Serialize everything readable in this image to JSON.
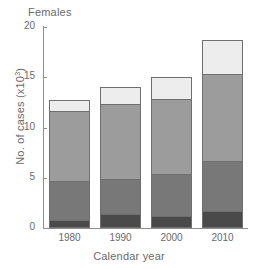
{
  "chart_data": {
    "type": "bar",
    "title": "Females",
    "subtitle": "",
    "xlabel": "Calendar year",
    "ylabel_prefix": "No. of cases (x10",
    "ylabel_sup": "3",
    "ylabel_suffix": ")",
    "ylabel_full": "No. of cases (x10³)",
    "categories": [
      "1980",
      "1990",
      "2000",
      "2010"
    ],
    "ylim": [
      0,
      20
    ],
    "yticks": [
      0,
      5,
      10,
      15,
      20
    ],
    "ytick_labels": [
      "0",
      "5",
      "10",
      "15",
      "20"
    ],
    "grid": false,
    "legend": "none",
    "stacked": true,
    "series": [
      {
        "name": "segment-1-bottom",
        "color": "#4a4a4a",
        "values": [
          0.8,
          1.4,
          1.2,
          1.7
        ]
      },
      {
        "name": "segment-2",
        "color": "#787878",
        "values": [
          4.0,
          3.6,
          4.3,
          5.1
        ]
      },
      {
        "name": "segment-3",
        "color": "#9c9c9c",
        "values": [
          7.0,
          7.5,
          7.5,
          8.7
        ]
      },
      {
        "name": "segment-4-top",
        "color": "#ededed",
        "values": [
          1.2,
          1.8,
          2.3,
          3.5
        ]
      }
    ],
    "totals": [
      13.0,
      14.3,
      15.3,
      19.0
    ]
  }
}
